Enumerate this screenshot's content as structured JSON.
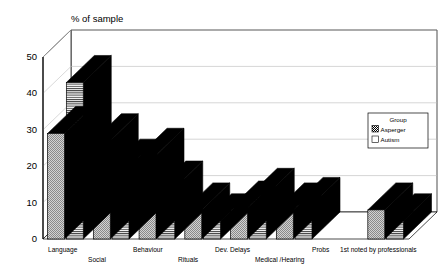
{
  "chart_data": {
    "type": "bar",
    "title": "% of sample",
    "subtitle": "",
    "xlabel": "1st noted by professionals",
    "ylabel": "% of sample",
    "ylim": [
      0,
      50
    ],
    "yticks": [
      0,
      10,
      20,
      30,
      40,
      50
    ],
    "grid": true,
    "threeD": true,
    "legend_position": "right",
    "legend_title": "Group",
    "categories": [
      "Language",
      "Social",
      "Behaviour",
      "Rituals",
      "Dev. Delays",
      "Medical /Hearing",
      "Probs",
      ""
    ],
    "series": [
      {
        "name": "Asperger",
        "pattern": "dotted",
        "values": [
          29,
          27,
          23,
          8,
          8.5,
          8,
          null,
          8
        ]
      },
      {
        "name": "Autism",
        "pattern": "horizontal-lines",
        "values": [
          43,
          20,
          14,
          5,
          12,
          9.5,
          null,
          5
        ]
      }
    ]
  },
  "chart": {
    "title": "% of sample",
    "xaxis_title": "1st noted by professionals",
    "ytick_labels": [
      "0",
      "10",
      "20",
      "30",
      "40",
      "50"
    ],
    "category_labels": [
      "Language",
      "Social",
      "Behaviour",
      "Rituals",
      "Dev. Delays",
      "Medical /Hearing",
      "Probs"
    ],
    "legend": {
      "title": "Group",
      "entries": [
        {
          "label": "Asperger",
          "pattern": "dotted"
        },
        {
          "label": "Autism",
          "pattern": "horizontal-lines"
        }
      ]
    },
    "colors": {
      "bar_face": "#c8c8c8",
      "bar_side": "#000000",
      "bar_top": "#000000",
      "grid": "#b4b4b4",
      "axis": "#000000",
      "background": "#ffffff"
    }
  }
}
